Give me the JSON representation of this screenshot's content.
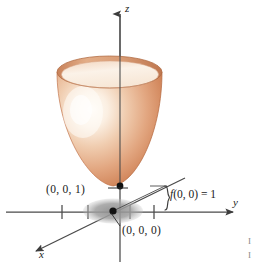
{
  "figure": {
    "type": "3d-surface-plot",
    "background_color": "#ffffff",
    "axes": {
      "z_label": "z",
      "y_label": "y",
      "x_label": "x",
      "axis_color": "#4a4a4a",
      "tick_count_y": 4
    },
    "points": {
      "vertex_label": "(0, 0, 1)",
      "origin_label": "(0, 0, 0)",
      "point_color": "#000000"
    },
    "annotation": {
      "function_text": "f(0, 0) = 1",
      "function_name": "f",
      "function_args": "(0, 0)",
      "function_equals": " = 1",
      "brace": "}"
    },
    "surface": {
      "fill_light": "#fdf6ee",
      "fill_mid": "#e8b392",
      "fill_dark": "#c87a4e",
      "rim_color": "#b9714a",
      "highlight_color": "#fffdf8"
    },
    "shadow": {
      "color": "#9a9a9a",
      "shape": "ellipse"
    },
    "edge_marks": [
      "I",
      "I"
    ]
  }
}
